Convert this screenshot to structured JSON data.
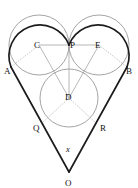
{
  "figure": {
    "canvas": {
      "width": 138,
      "height": 188,
      "background": "#ffffff"
    },
    "colors": {
      "outline": "#1c1c1c",
      "circle": "#8d8d8d",
      "thin": "#9a9a9a",
      "dotted": "#a8a8a8",
      "label": "#111111"
    },
    "labels": {
      "A": "A",
      "B": "B",
      "C": "C",
      "D": "D",
      "E": "E",
      "P": "P",
      "Q": "Q",
      "R": "R",
      "O": "O",
      "angle": "x"
    },
    "label_positions": {
      "A": {
        "x": 4,
        "y": 74
      },
      "B": {
        "x": 126,
        "y": 74
      },
      "C": {
        "x": 34,
        "y": 48
      },
      "D": {
        "x": 65,
        "y": 99
      },
      "E": {
        "x": 95,
        "y": 48
      },
      "P": {
        "x": 70,
        "y": 48
      },
      "Q": {
        "x": 33,
        "y": 131
      },
      "R": {
        "x": 100,
        "y": 131
      },
      "O": {
        "x": 66,
        "y": 186
      },
      "angle": {
        "x": 67,
        "y": 151
      }
    },
    "points": {
      "A": {
        "x": 11,
        "y": 67
      },
      "B": {
        "x": 127,
        "y": 67
      },
      "C": {
        "x": 39,
        "y": 45
      },
      "D": {
        "x": 69,
        "y": 98
      },
      "E": {
        "x": 99,
        "y": 45
      },
      "P": {
        "x": 69,
        "y": 45
      },
      "Q": {
        "x": 41,
        "y": 124
      },
      "R": {
        "x": 97,
        "y": 124
      },
      "O": {
        "x": 69,
        "y": 172
      }
    },
    "circles": [
      {
        "name": "left-circle",
        "cx": 39,
        "cy": 45,
        "r": 30
      },
      {
        "name": "right-circle",
        "cx": 99,
        "cy": 45,
        "r": 30
      },
      {
        "name": "bottom-circle",
        "cx": 69,
        "cy": 98,
        "r": 29
      }
    ],
    "segments": [
      {
        "name": "chord-C-P-E",
        "from": "C",
        "to": "E"
      },
      {
        "name": "radius-C-A",
        "from": "C",
        "to": "A",
        "style": "dotted"
      },
      {
        "name": "radius-E-B",
        "from": "E",
        "to": "B",
        "style": "dotted"
      },
      {
        "name": "radius-D-Q",
        "from": "D",
        "to": "Q",
        "style": "dotted"
      },
      {
        "name": "radius-D-R",
        "from": "D",
        "to": "R",
        "style": "dotted"
      },
      {
        "name": "line-C-D",
        "from": "C",
        "to": "D",
        "style": "solid"
      },
      {
        "name": "line-E-D",
        "from": "E",
        "to": "D",
        "style": "solid"
      },
      {
        "name": "line-D-P",
        "from": "D",
        "to": "P",
        "style": "solid"
      },
      {
        "name": "tangent-A-O",
        "from": "A",
        "to": "O",
        "style": "heart"
      },
      {
        "name": "tangent-B-O",
        "from": "B",
        "to": "O",
        "style": "heart"
      }
    ]
  }
}
